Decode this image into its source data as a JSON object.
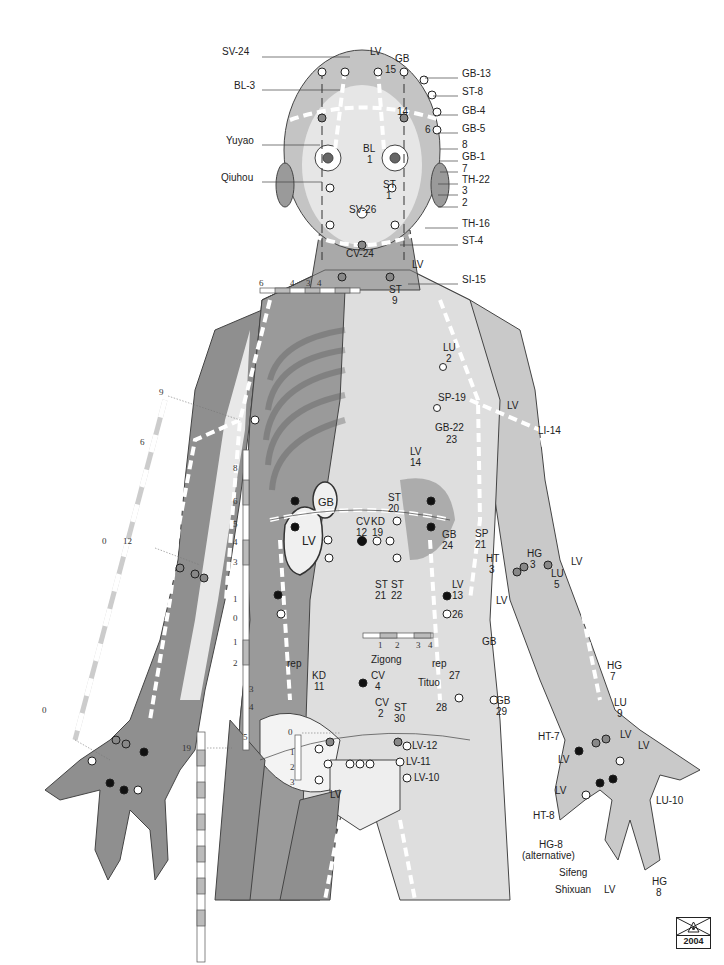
{
  "figure": {
    "colors": {
      "skin_dark": "#8c8c8c",
      "skin_mid": "#b5b5b5",
      "skin_light": "#d9d9d9",
      "bone": "#f2f2f2",
      "line": "#333333",
      "point_dark": "#111111",
      "point_grey": "#888888"
    },
    "stamp_year": "2004"
  },
  "labels": {
    "head_left": [
      {
        "id": "sv24",
        "text": "SV-24",
        "x": 236,
        "y": 52
      },
      {
        "id": "bl3",
        "text": "BL-3",
        "x": 240,
        "y": 85
      },
      {
        "id": "yuyao",
        "text": "Yuyao",
        "x": 233,
        "y": 140
      },
      {
        "id": "qiuhou",
        "text": "Qiuhou",
        "x": 227,
        "y": 177
      }
    ],
    "head_top": [
      {
        "id": "lv_head",
        "text": "LV",
        "x": 370,
        "y": 51
      },
      {
        "id": "gb_head",
        "text": "GB",
        "x": 397,
        "y": 58
      },
      {
        "id": "gb15_num",
        "text": "15",
        "x": 386,
        "y": 69
      },
      {
        "id": "gb14_num",
        "text": "14",
        "x": 397,
        "y": 111
      },
      {
        "id": "gb6_num",
        "text": "6",
        "x": 425,
        "y": 129
      },
      {
        "id": "bl_face",
        "text": "BL",
        "x": 364,
        "y": 148
      },
      {
        "id": "bl1_num",
        "text": "1",
        "x": 367,
        "y": 159
      },
      {
        "id": "st_face",
        "text": "ST",
        "x": 384,
        "y": 184
      },
      {
        "id": "st1_num",
        "text": "1",
        "x": 386,
        "y": 195
      },
      {
        "id": "sv26",
        "text": "SV-26",
        "x": 352,
        "y": 209
      },
      {
        "id": "cv24",
        "text": "CV-24",
        "x": 349,
        "y": 253
      }
    ],
    "head_right": [
      {
        "id": "gb13",
        "text": "GB-13",
        "x": 462,
        "y": 73
      },
      {
        "id": "st8",
        "text": "ST-8",
        "x": 462,
        "y": 91
      },
      {
        "id": "gb4",
        "text": "GB-4",
        "x": 462,
        "y": 110
      },
      {
        "id": "gb5",
        "text": "GB-5",
        "x": 462,
        "y": 128
      },
      {
        "id": "gb8",
        "text": "8",
        "x": 462,
        "y": 144
      },
      {
        "id": "gb1",
        "text": "GB-1",
        "x": 462,
        "y": 156
      },
      {
        "id": "gb7",
        "text": "7",
        "x": 462,
        "y": 168
      },
      {
        "id": "th22",
        "text": "TH-22",
        "x": 462,
        "y": 179
      },
      {
        "id": "gb3",
        "text": "3",
        "x": 462,
        "y": 190
      },
      {
        "id": "gb2",
        "text": "2",
        "x": 462,
        "y": 202
      },
      {
        "id": "th16",
        "text": "TH-16",
        "x": 462,
        "y": 223
      },
      {
        "id": "st4",
        "text": "ST-4",
        "x": 462,
        "y": 240
      }
    ],
    "neck": [
      {
        "id": "lv_neck",
        "text": "LV",
        "x": 412,
        "y": 264
      },
      {
        "id": "si15",
        "text": "SI-15",
        "x": 462,
        "y": 279
      },
      {
        "id": "st_neck",
        "text": "ST",
        "x": 391,
        "y": 289
      },
      {
        "id": "st9_num",
        "text": "9",
        "x": 393,
        "y": 300
      }
    ],
    "chest": [
      {
        "id": "lu_chest",
        "text": "LU",
        "x": 443,
        "y": 347
      },
      {
        "id": "lu2_num",
        "text": "2",
        "x": 445,
        "y": 358
      },
      {
        "id": "sp19",
        "text": "SP-19",
        "x": 438,
        "y": 397
      },
      {
        "id": "lv_shoulder",
        "text": "LV",
        "x": 507,
        "y": 405
      },
      {
        "id": "li14",
        "text": "LI-14",
        "x": 538,
        "y": 430
      },
      {
        "id": "gb22",
        "text": "GB-22",
        "x": 435,
        "y": 427
      },
      {
        "id": "gb23_num",
        "text": "23",
        "x": 446,
        "y": 439
      },
      {
        "id": "lv14",
        "text": "LV",
        "x": 410,
        "y": 451
      },
      {
        "id": "lv14_num",
        "text": "14",
        "x": 410,
        "y": 462
      },
      {
        "id": "st20",
        "text": "ST",
        "x": 388,
        "y": 497
      },
      {
        "id": "st20_num",
        "text": "20",
        "x": 388,
        "y": 508
      },
      {
        "id": "cv12",
        "text": "CV",
        "x": 357,
        "y": 516
      },
      {
        "id": "cv12_num",
        "text": "12",
        "x": 357,
        "y": 527
      },
      {
        "id": "kd19",
        "text": "KD",
        "x": 373,
        "y": 516
      },
      {
        "id": "kd19_num",
        "text": "19",
        "x": 373,
        "y": 527
      },
      {
        "id": "gb_organ",
        "text": "GB",
        "x": 322,
        "y": 502
      },
      {
        "id": "lv_organ",
        "text": "LV",
        "x": 306,
        "y": 541
      },
      {
        "id": "gb24",
        "text": "GB",
        "x": 442,
        "y": 534
      },
      {
        "id": "gb24_num",
        "text": "24",
        "x": 442,
        "y": 545
      },
      {
        "id": "sp21",
        "text": "SP",
        "x": 475,
        "y": 533
      },
      {
        "id": "sp21_num",
        "text": "21",
        "x": 475,
        "y": 544
      },
      {
        "id": "st21",
        "text": "ST",
        "x": 377,
        "y": 579
      },
      {
        "id": "st21_num",
        "text": "21",
        "x": 377,
        "y": 590
      },
      {
        "id": "st22",
        "text": "ST",
        "x": 393,
        "y": 579
      },
      {
        "id": "st22_num",
        "text": "22",
        "x": 393,
        "y": 590
      },
      {
        "id": "lv13",
        "text": "LV",
        "x": 452,
        "y": 580
      },
      {
        "id": "lv13_num",
        "text": "13",
        "x": 452,
        "y": 591
      },
      {
        "id": "gb26_num",
        "text": "26",
        "x": 452,
        "y": 613
      }
    ],
    "abdomen": [
      {
        "id": "zigong",
        "text": "Zigong",
        "x": 373,
        "y": 655
      },
      {
        "id": "rep_left",
        "text": "rep",
        "x": 289,
        "y": 661
      },
      {
        "id": "rep_right",
        "text": "rep",
        "x": 434,
        "y": 661
      },
      {
        "id": "kd11",
        "text": "KD",
        "x": 313,
        "y": 673
      },
      {
        "id": "kd11_num",
        "text": "11",
        "x": 315,
        "y": 684
      },
      {
        "id": "cv4",
        "text": "CV",
        "x": 373,
        "y": 672
      },
      {
        "id": "cv4_num",
        "text": "4",
        "x": 375,
        "y": 683
      },
      {
        "id": "tituo",
        "text": "Tituo",
        "x": 420,
        "y": 680
      },
      {
        "id": "gb27_num",
        "text": "27",
        "x": 449,
        "y": 673
      },
      {
        "id": "gb_hip",
        "text": "GB",
        "x": 482,
        "y": 640
      },
      {
        "id": "cv2",
        "text": "CV",
        "x": 376,
        "y": 698
      },
      {
        "id": "cv2_num",
        "text": "2",
        "x": 378,
        "y": 709
      },
      {
        "id": "st30",
        "text": "ST",
        "x": 394,
        "y": 704
      },
      {
        "id": "st30_num",
        "text": "30",
        "x": 394,
        "y": 715
      },
      {
        "id": "gb28_num",
        "text": "28",
        "x": 437,
        "y": 704
      },
      {
        "id": "gb29",
        "text": "GB",
        "x": 496,
        "y": 697
      },
      {
        "id": "gb29_num",
        "text": "29",
        "x": 496,
        "y": 708
      },
      {
        "id": "lv12",
        "text": "LV-12",
        "x": 412,
        "y": 743
      },
      {
        "id": "lv11",
        "text": "LV-11",
        "x": 406,
        "y": 760
      },
      {
        "id": "lv10",
        "text": "LV-10",
        "x": 414,
        "y": 774
      },
      {
        "id": "lv_groin",
        "text": "LV",
        "x": 330,
        "y": 793
      }
    ],
    "right_arm": [
      {
        "id": "ht3",
        "text": "HT",
        "x": 486,
        "y": 555
      },
      {
        "id": "ht3_num",
        "text": "3",
        "x": 489,
        "y": 566
      },
      {
        "id": "hg3",
        "text": "HG",
        "x": 527,
        "y": 550
      },
      {
        "id": "hg3_num",
        "text": "3",
        "x": 530,
        "y": 561
      },
      {
        "id": "lv_elbow",
        "text": "LV",
        "x": 571,
        "y": 558
      },
      {
        "id": "lu5",
        "text": "LU",
        "x": 551,
        "y": 569
      },
      {
        "id": "lu5_num",
        "text": "5",
        "x": 554,
        "y": 580
      },
      {
        "id": "lv_elbow2",
        "text": "LV",
        "x": 496,
        "y": 597
      },
      {
        "id": "hg7",
        "text": "HG",
        "x": 607,
        "y": 661
      },
      {
        "id": "hg7_num",
        "text": "7",
        "x": 610,
        "y": 672
      },
      {
        "id": "lu9",
        "text": "LU",
        "x": 614,
        "y": 698
      },
      {
        "id": "lu9_num",
        "text": "9",
        "x": 617,
        "y": 709
      },
      {
        "id": "lv_wrist1",
        "text": "LV",
        "x": 620,
        "y": 731
      },
      {
        "id": "lv_wrist2",
        "text": "LV",
        "x": 636,
        "y": 742
      },
      {
        "id": "ht7",
        "text": "HT-7",
        "x": 538,
        "y": 733
      },
      {
        "id": "lv_wrist3",
        "text": "LV",
        "x": 558,
        "y": 755
      },
      {
        "id": "lv_hand",
        "text": "LV",
        "x": 555,
        "y": 786
      },
      {
        "id": "lu10",
        "text": "LU-10",
        "x": 656,
        "y": 797
      },
      {
        "id": "ht8",
        "text": "HT-8",
        "x": 533,
        "y": 811
      },
      {
        "id": "hg8_alt",
        "text": "HG-8",
        "x": 539,
        "y": 840
      },
      {
        "id": "hg8_alt_note",
        "text": "(alternative)",
        "x": 522,
        "y": 851
      },
      {
        "id": "sifeng",
        "text": "Sifeng",
        "x": 559,
        "y": 868
      },
      {
        "id": "hg8",
        "text": "HG",
        "x": 652,
        "y": 877
      },
      {
        "id": "hg8_num",
        "text": "8",
        "x": 656,
        "y": 888
      },
      {
        "id": "shixuan",
        "text": "Shixuan",
        "x": 555,
        "y": 885
      },
      {
        "id": "lv_finger",
        "text": "LV",
        "x": 604,
        "y": 885
      }
    ]
  },
  "scales": {
    "neck_ruler": {
      "ticks": [
        "6",
        "4",
        "3",
        "4"
      ]
    },
    "upper_arm_ruler": {
      "ticks": [
        "9",
        "6",
        "0"
      ]
    },
    "forearm_ruler": {
      "ticks": [
        "12",
        "0"
      ]
    },
    "torso_ruler": {
      "ticks": [
        "8",
        "6",
        "5",
        "4",
        "3",
        "1",
        "0",
        "1",
        "2",
        "3",
        "4",
        "5"
      ]
    },
    "abdomen_ruler": {
      "ticks": [
        "1",
        "2",
        "3",
        "4"
      ]
    },
    "pubic_ruler": {
      "ticks": [
        "0",
        "1",
        "2",
        "3"
      ]
    },
    "thigh_ruler": {
      "ticks": [
        "19"
      ]
    }
  }
}
